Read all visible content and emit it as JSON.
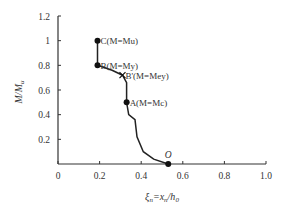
{
  "chart_data": {
    "type": "line",
    "title": "",
    "xlabel": "ξn=xn/h0",
    "ylabel": "M/Mu",
    "xlim": [
      0,
      1.0
    ],
    "ylim": [
      0,
      1.2
    ],
    "x_ticks": [
      "0",
      "0.2",
      "0.4",
      "0.6",
      "0.8",
      "1.0"
    ],
    "y_ticks": [
      "0.2",
      "0.4",
      "0.6",
      "0.8",
      "1",
      "1.2"
    ],
    "grid": false,
    "series": [
      {
        "name": "M/Mu vs ξn",
        "points": [
          {
            "x": 0.19,
            "y": 1.0
          },
          {
            "x": 0.19,
            "y": 0.8
          },
          {
            "x": 0.26,
            "y": 0.76
          },
          {
            "x": 0.31,
            "y": 0.72
          },
          {
            "x": 0.33,
            "y": 0.66
          },
          {
            "x": 0.33,
            "y": 0.5
          },
          {
            "x": 0.34,
            "y": 0.4
          },
          {
            "x": 0.37,
            "y": 0.36
          },
          {
            "x": 0.38,
            "y": 0.22
          },
          {
            "x": 0.41,
            "y": 0.1
          },
          {
            "x": 0.46,
            "y": 0.04
          },
          {
            "x": 0.53,
            "y": 0.0
          }
        ]
      }
    ],
    "annotations": [
      {
        "label": "C(M=Mu)",
        "x": 0.19,
        "y": 1.0,
        "marker": "dot"
      },
      {
        "label": "B(M=My)",
        "x": 0.19,
        "y": 0.8,
        "marker": "dot"
      },
      {
        "label": "B'(M=Mey)",
        "x": 0.31,
        "y": 0.72,
        "marker": "cross"
      },
      {
        "label": "A(M=Mc)",
        "x": 0.33,
        "y": 0.5,
        "marker": "dot"
      },
      {
        "label": "O",
        "x": 0.53,
        "y": 0.0,
        "marker": "dot"
      }
    ]
  }
}
